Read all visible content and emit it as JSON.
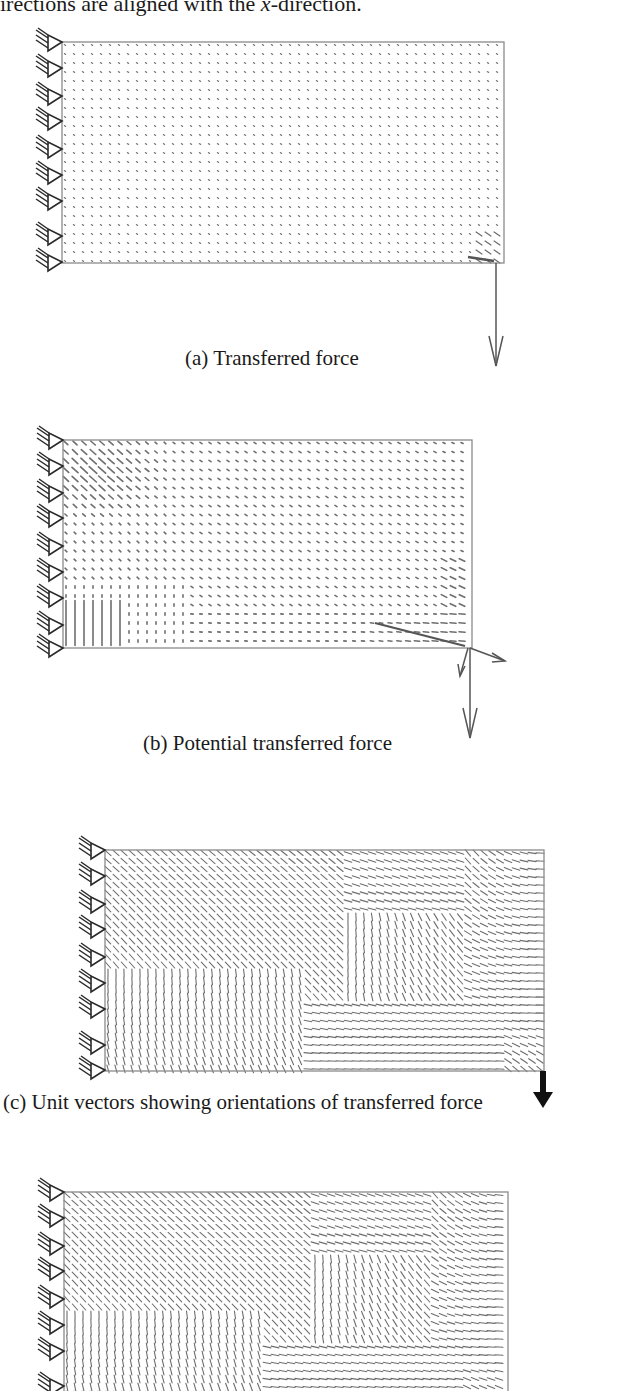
{
  "intro_text": {
    "before": "irections are aligned with the ",
    "var": "x",
    "after": "-direction."
  },
  "figures": [
    {
      "id": "a",
      "caption": "(a) Transferred force",
      "caption_pos": {
        "x": 185,
        "y": 368
      },
      "plate": {
        "x": 62,
        "y": 42,
        "w": 442,
        "h": 221
      },
      "supports_y": [
        42,
        68,
        96,
        121,
        149,
        175,
        201,
        236,
        262
      ],
      "field": "transferred",
      "load": {
        "type": "thin-arrow",
        "x": 496,
        "y1": 263,
        "y2": 366
      },
      "stroke": "#777777"
    },
    {
      "id": "b",
      "caption": "(b) Potential transferred force",
      "caption_pos": {
        "x": 143,
        "y": 753
      },
      "plate": {
        "x": 63,
        "y": 440,
        "w": 409,
        "h": 208
      },
      "supports_y": [
        440,
        466,
        493,
        518,
        546,
        572,
        598,
        625,
        648
      ],
      "field": "potential",
      "load": {
        "type": "thin-arrow-multi",
        "x": 470,
        "y1": 648,
        "y2": 738
      },
      "stroke": "#666666"
    },
    {
      "id": "c",
      "caption": "(c) Unit vectors showing orientations of transferred force",
      "caption_pos": {
        "x": 3,
        "y": 1112
      },
      "plate": {
        "x": 105,
        "y": 850,
        "w": 439,
        "h": 221
      },
      "supports_y": [
        850,
        876,
        904,
        929,
        957,
        983,
        1009,
        1045,
        1070
      ],
      "field": "unit",
      "load": {
        "type": "bold-arrow",
        "x": 543,
        "y1": 1071,
        "y2": 1108
      },
      "stroke": "#7a7a7a"
    },
    {
      "id": "d",
      "caption": "",
      "caption_pos": {
        "x": 0,
        "y": 0
      },
      "plate": {
        "x": 64,
        "y": 1192,
        "w": 444,
        "h": 221
      },
      "supports_y": [
        1192,
        1218,
        1246,
        1271,
        1299,
        1325,
        1351,
        1386,
        1412
      ],
      "field": "unit",
      "load": {
        "type": "none"
      },
      "stroke": "#7a7a7a"
    }
  ],
  "colors": {
    "plate_border": "#8a8a8a",
    "support": "#2a2a2a",
    "vectors": "#6e6e6e",
    "load_arrow": "#555555",
    "bold_arrow": "#111111"
  }
}
